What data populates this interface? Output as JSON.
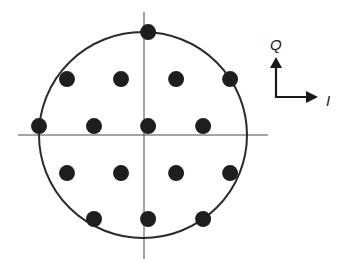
{
  "diagram": {
    "type": "constellation",
    "legend": {
      "q_label": "Q",
      "i_label": "I"
    },
    "colors": {
      "points": "#1e1e1e",
      "circle": "#2b2b2b",
      "axes": "#4a4a4a",
      "background": "#ffffff"
    },
    "circle_radius_units": 3.83,
    "points": [
      {
        "i": 0.15,
        "q": 3.81
      },
      {
        "i": -2.85,
        "q": 2.07
      },
      {
        "i": -0.85,
        "q": 2.07
      },
      {
        "i": 1.19,
        "q": 2.07
      },
      {
        "i": 3.19,
        "q": 2.07
      },
      {
        "i": -3.89,
        "q": 0.33
      },
      {
        "i": -1.85,
        "q": 0.33
      },
      {
        "i": 0.15,
        "q": 0.33
      },
      {
        "i": 2.19,
        "q": 0.33
      },
      {
        "i": -2.85,
        "q": -1.41
      },
      {
        "i": -0.85,
        "q": -1.41
      },
      {
        "i": 1.19,
        "q": -1.41
      },
      {
        "i": 3.19,
        "q": -1.41
      },
      {
        "i": -1.85,
        "q": -3.11
      },
      {
        "i": 0.15,
        "q": -3.11
      },
      {
        "i": 2.19,
        "q": -3.11
      }
    ]
  }
}
